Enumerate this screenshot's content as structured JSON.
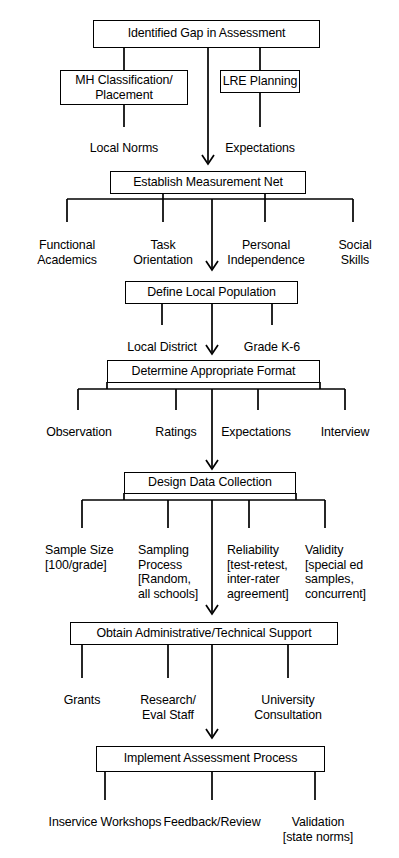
{
  "diagram": {
    "stroke_color": "#000000",
    "background_color": "#ffffff",
    "stages": [
      {
        "id": "identified-gap",
        "box": "Identified Gap  in Assessment",
        "children": [
          {
            "label": "MH Classification/\nPlacement",
            "type": "box"
          },
          {
            "label": "LRE Planning",
            "type": "box"
          }
        ],
        "grandchildren": [
          {
            "label": "Local Norms",
            "parent": "MH Classification/Placement"
          },
          {
            "label": "Expectations",
            "parent": "LRE Planning"
          }
        ]
      },
      {
        "id": "establish-measurement-net",
        "box": "Establish Measurement Net",
        "children": [
          {
            "label": "Functional\nAcademics"
          },
          {
            "label": "Task\nOrientation"
          },
          {
            "label": "Personal\nIndependence"
          },
          {
            "label": "Social\nSkills"
          }
        ]
      },
      {
        "id": "define-local-population",
        "box": "Define Local Population",
        "children": [
          {
            "label": "Local District"
          },
          {
            "label": "Grade K-6"
          }
        ]
      },
      {
        "id": "determine-appropriate-format",
        "box": "Determine Appropriate Format",
        "children": [
          {
            "label": "Observation"
          },
          {
            "label": "Ratings"
          },
          {
            "label": "Expectations"
          },
          {
            "label": "Interview"
          }
        ]
      },
      {
        "id": "design-data-collection",
        "box": "Design Data Collection",
        "children": [
          {
            "label": "Sample Size\n[100/grade]"
          },
          {
            "label": "Sampling\nProcess\n[Random,\nall schools]"
          },
          {
            "label": "Reliability\n[test-retest,\ninter-rater\nagreement]"
          },
          {
            "label": "Validity\n[special ed\nsamples,\nconcurrent]"
          }
        ]
      },
      {
        "id": "obtain-administrative-technical-support",
        "box": "Obtain Administrative/Technical Support",
        "children": [
          {
            "label": "Grants"
          },
          {
            "label": "Research/\nEval Staff"
          },
          {
            "label": "University Consultation"
          }
        ]
      },
      {
        "id": "implement-assessment-process",
        "box": "Implement Assessment Process",
        "children": [
          {
            "label": "Inservice Workshops"
          },
          {
            "label": "Feedback/Review"
          },
          {
            "label": "Validation\n[state norms]"
          }
        ]
      }
    ]
  }
}
